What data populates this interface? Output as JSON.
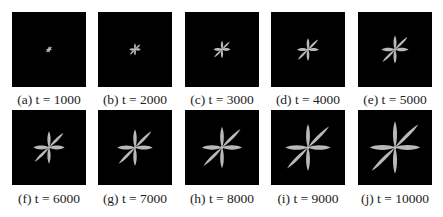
{
  "figure": {
    "crystal_color": "#b9b9b9",
    "background_color": "#000000",
    "panels": [
      {
        "label": "(a) t = 1000",
        "t": 1000,
        "scale": 0.11,
        "row": 0,
        "col": 0
      },
      {
        "label": "(b) t = 2000",
        "t": 2000,
        "scale": 0.22,
        "row": 0,
        "col": 1
      },
      {
        "label": "(c) t = 3000",
        "t": 3000,
        "scale": 0.32,
        "row": 0,
        "col": 2
      },
      {
        "label": "(d) t = 4000",
        "t": 4000,
        "scale": 0.42,
        "row": 0,
        "col": 3
      },
      {
        "label": "(e) t = 5000",
        "t": 5000,
        "scale": 0.52,
        "row": 0,
        "col": 4
      },
      {
        "label": "(f) t = 6000",
        "t": 6000,
        "scale": 0.6,
        "row": 1,
        "col": 0
      },
      {
        "label": "(g) t = 7000",
        "t": 7000,
        "scale": 0.68,
        "row": 1,
        "col": 1
      },
      {
        "label": "(h) t = 8000",
        "t": 8000,
        "scale": 0.77,
        "row": 1,
        "col": 2
      },
      {
        "label": "(i) t = 9000",
        "t": 9000,
        "scale": 0.87,
        "row": 1,
        "col": 3
      },
      {
        "label": "(j) t = 10000",
        "t": 10000,
        "scale": 0.97,
        "row": 1,
        "col": 4
      }
    ]
  }
}
